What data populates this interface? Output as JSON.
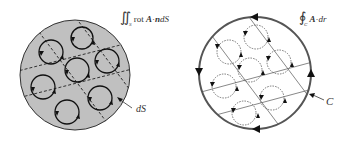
{
  "left_panel": {
    "title": "Surface integral of curl over S",
    "formula": {
      "integral": "∬",
      "subscript": "S",
      "text": "rot ",
      "vecA": "A",
      "dot": "·",
      "vecn": "n",
      "tail": "dS"
    },
    "element_label": "dS",
    "fill_color": "#c0c0c0",
    "stroke_color": "#222222",
    "loop_count": 8
  },
  "right_panel": {
    "title": "Line integral around boundary C",
    "formula": {
      "integral": "∮",
      "subscript": "C",
      "vecA": "A",
      "dot": "·",
      "tail": "dr"
    },
    "contour_label": "C",
    "fill_color": "#ffffff",
    "stroke_color": "#555555",
    "loop_count": 8
  }
}
